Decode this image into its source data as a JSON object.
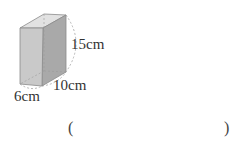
{
  "figure": {
    "type": "rectangular-prism",
    "dimensions": {
      "height": "15cm",
      "depth": "10cm",
      "width": "6cm"
    },
    "colors": {
      "front_face": "#c9c9c9",
      "side_face": "#a9a9a9",
      "top_face": "#e2e2e2",
      "edge": "#8a8a8a",
      "hidden_edge": "#9a9a9a"
    }
  },
  "answer": {
    "open_paren": "(",
    "close_paren": ")",
    "value": ""
  }
}
